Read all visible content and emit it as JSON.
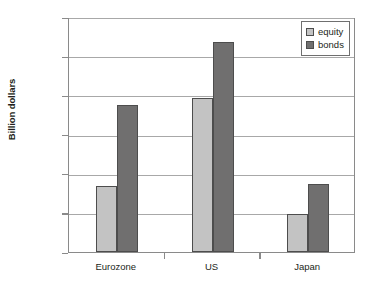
{
  "chart_data": {
    "type": "bar",
    "title": "",
    "xlabel": "",
    "ylabel": "Billion dollars",
    "categories": [
      "Eurozone",
      "US",
      "Japan"
    ],
    "series": [
      {
        "name": "equity",
        "color": "#c3c3c3",
        "values": [
          8400,
          19600,
          4850
        ]
      },
      {
        "name": "bonds",
        "color": "#706f6f",
        "values": [
          18800,
          26800,
          8700
        ]
      }
    ],
    "ylim": [
      0,
      30000
    ],
    "ytick_labels": [
      "30,000",
      "25,000",
      "20,000",
      "15,000",
      "10,000",
      "5,000",
      "0"
    ],
    "ytick_values": [
      30000,
      25000,
      20000,
      15000,
      10000,
      5000,
      0
    ],
    "grid": true,
    "legend_position": "top-right"
  },
  "legend": {
    "items": [
      {
        "label": "equity"
      },
      {
        "label": "bonds"
      }
    ]
  }
}
